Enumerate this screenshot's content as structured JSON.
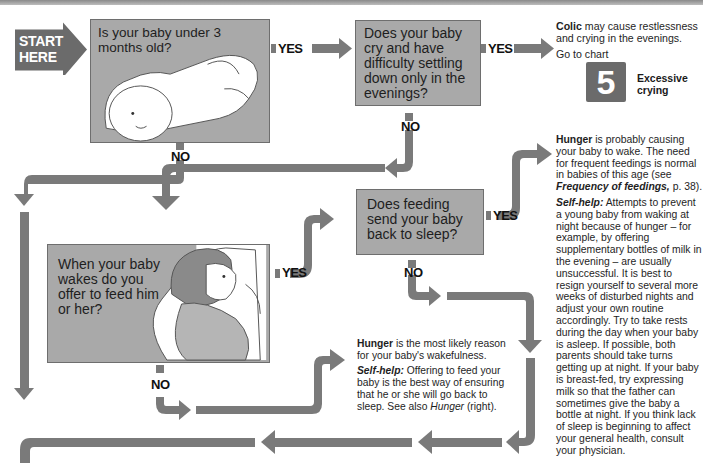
{
  "header": {
    "bar_color": "#9e9e9e"
  },
  "start": {
    "label_line1": "START",
    "label_line2": "HERE",
    "color": "#6b6b6b"
  },
  "questions": [
    {
      "id": "q1",
      "text": "Is your baby under 3 months old?"
    },
    {
      "id": "q2",
      "text": "Does your baby cry and have difficulty settling down only in the evenings?"
    },
    {
      "id": "q3",
      "text": "Does feeding send your baby back to sleep?"
    },
    {
      "id": "q4",
      "text": "When your baby wakes do you offer to feed him or her?"
    }
  ],
  "labels": {
    "yes": "YES",
    "no": "NO"
  },
  "outcomes": {
    "colic": {
      "heading": "Colic",
      "text": " may cause restlessness and crying in the evenings.",
      "goto": "Go to chart",
      "chart_number": "5",
      "chart_title_line1": "Excessive",
      "chart_title_line2": "crying"
    },
    "hunger_right": {
      "heading": "Hunger",
      "text1": " is probably causing your baby to wake. The need for frequent feedings is normal in babies of this age (see ",
      "ref": "Frequency of feedings,",
      "text2": " p. 38).",
      "selfhelp_label": "Self-help:",
      "selfhelp_text": " Attempts to prevent a young baby from waking at night because of hunger – for example, by offering supplementary bottles of milk in the evening – are usually unsuccessful. It is best to resign yourself to several more weeks of disturbed nights and adjust your own routine accordingly. Try to take rests during the day when your baby is asleep. If possible, both parents should take turns getting up at night. If your baby is breast-fed, try expressing milk so that the father can sometimes give the baby a bottle at night. If you think lack of sleep is beginning to affect your general health, consult your physician."
    },
    "hunger_center": {
      "heading": "Hunger",
      "text": " is the most likely reason for your baby's wakefulness.",
      "selfhelp_label": "Self-help:",
      "selfhelp_text": " Offering to feed your baby is the best way of ensuring that he or she will go back to sleep. See also ",
      "ref": "Hunger",
      "tail": " (right)."
    }
  },
  "colors": {
    "box_fill": "#a9a9a9",
    "arrow": "#7a7a7a",
    "dark_box": "#6b6b6b",
    "text": "#1e1e1e"
  }
}
